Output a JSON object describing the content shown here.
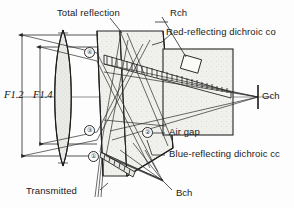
{
  "figure": {
    "type": "optical-ray-diagram",
    "background": "#fdfdfd",
    "line_color": "#262626",
    "glass_tint": "#e8e8e4"
  },
  "labels": {
    "total_reflection": "Total reflection",
    "rch": "Rch",
    "red_dichroic": "Red-reflecting dichroic co",
    "gch": "Gch",
    "air_gap": "Air gap",
    "blue_dichroic": "Blue-reflecting dichroic cc",
    "transmitted": "Transmitted",
    "bch": "Bch",
    "f_number_outer": "F1.2",
    "f_number_inner": "F1.4"
  },
  "markers": [
    {
      "id": "m4a",
      "text": "④",
      "x": 84,
      "y": 47
    },
    {
      "id": "m3",
      "text": "③",
      "x": 84,
      "y": 125
    },
    {
      "id": "m1",
      "text": "①",
      "x": 88,
      "y": 151
    },
    {
      "id": "m2",
      "text": "②",
      "x": 142,
      "y": 127
    }
  ],
  "channels": {
    "red": "Rch",
    "green": "Gch",
    "blue": "Bch"
  },
  "apertures": {
    "outer": "F1.2",
    "inner": "F1.4"
  },
  "icons": {
    "leader_line": "leader-line-icon",
    "arrow_head": "arrow-head-icon",
    "hatch_band": "dichroic-hatch-icon"
  }
}
